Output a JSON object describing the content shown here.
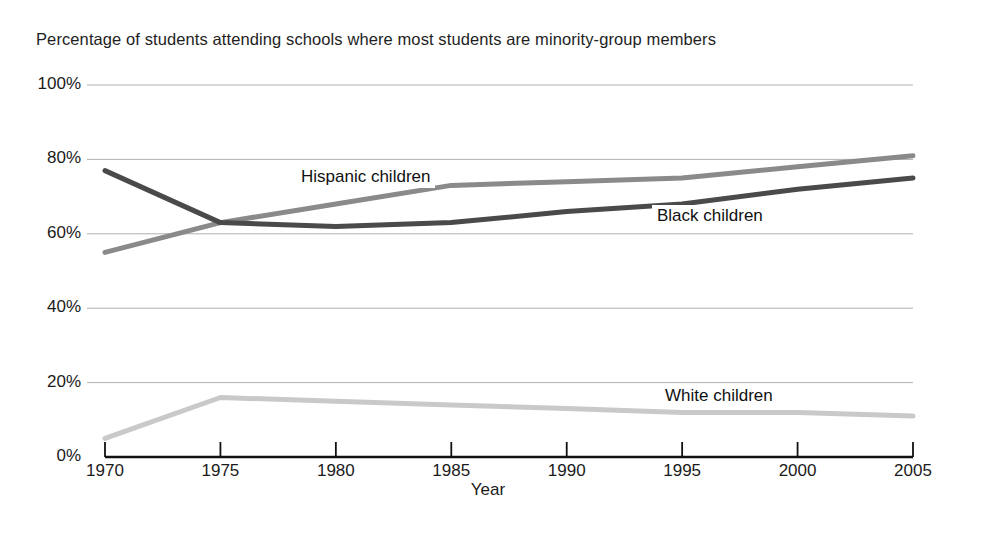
{
  "chart_data": {
    "type": "line",
    "title": "Percentage of students attending schools where most students are minority-group members",
    "xlabel": "Year",
    "ylabel": "",
    "xlim": [
      1970,
      2005
    ],
    "ylim": [
      0,
      100
    ],
    "grid": true,
    "legend_position": "inline-annotations",
    "x": [
      1970,
      1975,
      1980,
      1985,
      1990,
      1995,
      2000,
      2005
    ],
    "xtick_labels": [
      "1970",
      "1975",
      "1980",
      "1985",
      "1990",
      "1995",
      "2000",
      "2005"
    ],
    "ytick_labels": [
      "0%",
      "20%",
      "40%",
      "60%",
      "80%",
      "100%"
    ],
    "ytick_values": [
      0,
      20,
      40,
      60,
      80,
      100
    ],
    "series": [
      {
        "name": "Hispanic children",
        "color": "#8a8a8a",
        "values": [
          55,
          63,
          68,
          73,
          74,
          75,
          78,
          81
        ],
        "annotation": "Hispanic children"
      },
      {
        "name": "Black children",
        "color": "#4a4a4a",
        "values": [
          77,
          63,
          62,
          63,
          66,
          68,
          72,
          75
        ],
        "annotation": "Black children"
      },
      {
        "name": "White children",
        "color": "#c9c9c9",
        "values": [
          5,
          16,
          15,
          14,
          13,
          12,
          12,
          11
        ],
        "annotation": "White children"
      }
    ]
  },
  "annotations": {
    "hispanic_label": "Hispanic children",
    "black_label": "Black children",
    "white_label": "White children"
  },
  "colors": {
    "axis": "#111111",
    "grid": "#b0b0b0",
    "background": "#ffffff",
    "hispanic": "#8a8a8a",
    "black": "#4a4a4a",
    "white_series": "#c9c9c9"
  }
}
